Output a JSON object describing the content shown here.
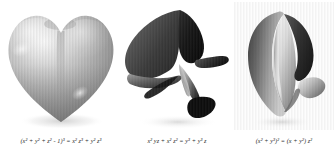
{
  "page": {
    "background_color": "#ffffff",
    "width": 334,
    "height": 157
  },
  "figures": [
    {
      "id": "heart-surface",
      "caption": "(x² + y² + z² - 1)³ = x² z³ + y² z³",
      "shape_name": "heart-surface",
      "tone": "light-gray",
      "colors": {
        "highlight": "#f2f2f2",
        "midtone": "#b4b4b4",
        "shadow": "#7d7d7d",
        "deep": "#5e5e5e"
      }
    },
    {
      "id": "folded-surface",
      "caption": "x² yz + x² z² = y³ + y³ z",
      "shape_name": "folded-cuspidal-surface",
      "tone": "high-contrast",
      "colors": {
        "highlight": "#ffffff",
        "midtone": "#909090",
        "shadow": "#3a3a3a",
        "deep": "#0a0a0a"
      }
    },
    {
      "id": "twisted-surface",
      "caption": "(x² + y³)² = (x + y²) z²",
      "shape_name": "twisted-ribbon-surface",
      "tone": "mid-gray",
      "colors": {
        "highlight": "#fbfbfb",
        "midtone": "#a8a8a8",
        "shadow": "#4e4e4e",
        "deep": "#2a2a2a"
      }
    }
  ]
}
